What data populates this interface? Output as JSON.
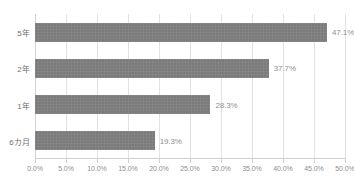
{
  "chart_data": {
    "type": "bar",
    "orientation": "horizontal",
    "title": "",
    "xlabel": "",
    "ylabel": "",
    "categories": [
      "5年",
      "2年",
      "1年",
      "6カ月"
    ],
    "values": [
      47.1,
      37.7,
      28.3,
      19.3
    ],
    "value_labels": [
      "47.1%",
      "37.7%",
      "28.3%",
      "19.3%"
    ],
    "xlim": [
      0,
      50
    ],
    "xticks": [
      0,
      5,
      10,
      15,
      20,
      25,
      30,
      35,
      40,
      45,
      50
    ],
    "xtick_labels": [
      "0.0%",
      "5.0%",
      "10.0%",
      "15.0%",
      "20.0%",
      "25.0%",
      "30.0%",
      "35.0%",
      "40.0%",
      "45.0%",
      "50.0%"
    ],
    "grid": true,
    "legend": false,
    "series_color": "#7b7b7b",
    "grid_color": "#e2e2e2",
    "axis_color": "#d0d0d0",
    "label_color": "#8f8f8f",
    "category_color": "#6f6f6f"
  }
}
